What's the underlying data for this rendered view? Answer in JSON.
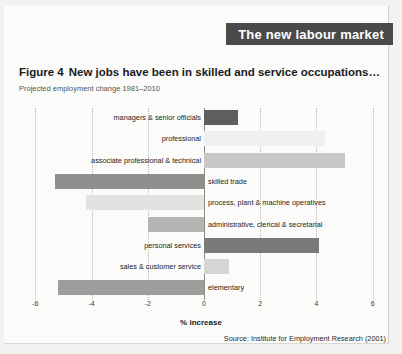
{
  "header": {
    "title": "The new labour market",
    "band_color": "#4a4a4a"
  },
  "figure": {
    "number": "Figure 4",
    "title": "New jobs have been in skilled and service occupations…",
    "subtitle": "Projected employment change 1981–2010",
    "source": "Source: Institute for Employment Research (2001)"
  },
  "chart_data": {
    "type": "bar",
    "orientation": "horizontal",
    "title": "New jobs have been in skilled and service occupations…",
    "subtitle": "Projected employment change 1981–2010",
    "xlabel": "% increase",
    "ylabel": "",
    "xlim": [
      -6,
      6
    ],
    "xticks": [
      -6,
      -4,
      -2,
      0,
      2,
      4,
      6
    ],
    "xticklabels": [
      "-6",
      "-4",
      "-2",
      "0",
      "2",
      "4",
      "6"
    ],
    "grid": "vertical-dotted",
    "legend": "none",
    "categories": [
      "managers & senior officials",
      "professional",
      "associate professional & technical",
      "skilled trade",
      "process, plant & machine operatives",
      "administrative, clerical & secretarial",
      "personal services",
      "sales & customer service",
      "elementary"
    ],
    "values": [
      1.2,
      4.3,
      5.0,
      -5.3,
      -4.2,
      -2.0,
      4.1,
      0.9,
      -5.2
    ],
    "bar_colors": [
      "#5e5e5e",
      "#f0f0ee",
      "#c8c8c6",
      "#8f8f8d",
      "#e2e2e0",
      "#b4b4b2",
      "#7a7a78",
      "#d5d5d3",
      "#9d9d9b"
    ]
  }
}
